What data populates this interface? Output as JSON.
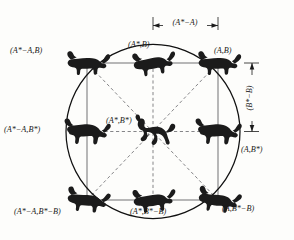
{
  "figure": {
    "type": "morphometric-transformation-diagram",
    "background_color": "#fdfdfb",
    "ink_color": "#1b1b1b",
    "circle": {
      "cx": 153,
      "cy": 131.5,
      "r": 87,
      "stroke": "#111111"
    },
    "square": {
      "left": 87,
      "top": 63,
      "right": 218,
      "bottom": 200,
      "stroke": "#58585a"
    },
    "dashed_lines_color": "#6f6f72"
  },
  "labels": {
    "top_left": "(A*−A,B)",
    "top_center": "(A*,B)",
    "top_right": "(A,B)",
    "middle_left": "(A*−A,B*)",
    "center": "(A*,B*)",
    "middle_right": "(A,B*)",
    "bottom_left": "(A*−A,B*−B)",
    "bottom_center": "(A*,B*−B)",
    "bottom_right": "(A,B*−B)"
  },
  "dimensions": {
    "horizontal": {
      "label": "(A*−A)",
      "orientation": "horizontal",
      "from_x": 153,
      "to_x": 218,
      "y": 23
    },
    "vertical": {
      "label": "(B*−B)",
      "orientation": "vertical",
      "x": 252,
      "from_y": 63,
      "to_y": 131.5
    }
  },
  "specimens": [
    {
      "position": "top-left",
      "icon": "carnivore-silhouette-icon",
      "x": 87,
      "y": 63
    },
    {
      "position": "top-center",
      "icon": "carnivore-silhouette-icon",
      "x": 153,
      "y": 63
    },
    {
      "position": "top-right",
      "icon": "carnivore-silhouette-icon",
      "x": 218,
      "y": 63
    },
    {
      "position": "middle-left",
      "icon": "hyena-silhouette-icon",
      "x": 87,
      "y": 131.5
    },
    {
      "position": "center",
      "icon": "horse-silhouette-icon",
      "x": 153,
      "y": 131.5
    },
    {
      "position": "middle-right",
      "icon": "hyena-silhouette-icon",
      "x": 218,
      "y": 131.5
    },
    {
      "position": "bottom-left",
      "icon": "carnivore-silhouette-icon",
      "x": 87,
      "y": 200
    },
    {
      "position": "bottom-center",
      "icon": "carnivore-silhouette-icon",
      "x": 153,
      "y": 200
    },
    {
      "position": "bottom-right",
      "icon": "carnivore-silhouette-icon",
      "x": 218,
      "y": 200
    }
  ]
}
